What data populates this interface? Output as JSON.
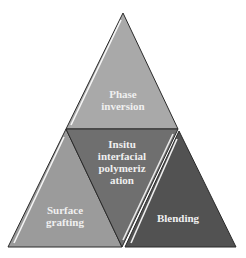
{
  "diagram": {
    "type": "triangle-pyramid",
    "segments": [
      {
        "id": "top",
        "lines": [
          "Phase",
          "inversion"
        ],
        "color": "#a9a9a9"
      },
      {
        "id": "center",
        "lines": [
          "Insitu",
          "interfacial",
          "polymeriz",
          "ation"
        ],
        "color": "#6f6f6f"
      },
      {
        "id": "left",
        "lines": [
          "Surface",
          "grafting"
        ],
        "color": "#9b9b9b"
      },
      {
        "id": "right",
        "lines": [
          "Blending"
        ],
        "color": "#525252"
      }
    ],
    "outline_color": "#2a2a2a",
    "highlight_color": "#ffffff"
  }
}
